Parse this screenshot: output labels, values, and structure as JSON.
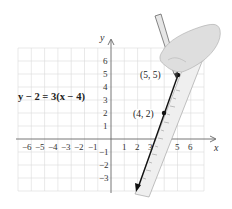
{
  "figure": {
    "equation": "y − 2 = 3(x − 4)",
    "axes": {
      "x_label": "x",
      "y_label": "y",
      "x_ticks": [
        "−6",
        "−5",
        "−4",
        "−3",
        "−2",
        "−1",
        "1",
        "2",
        "3",
        "4",
        "5",
        "6"
      ],
      "y_ticks": [
        "6",
        "5",
        "4",
        "3",
        "2",
        "1",
        "−1",
        "−2",
        "−3"
      ],
      "x_range": [
        -7,
        7
      ],
      "y_range": [
        -4,
        7
      ],
      "grid": true
    },
    "points": [
      {
        "label": "(5, 5)",
        "x": 5,
        "y": 5
      },
      {
        "label": "(4, 2)",
        "x": 4,
        "y": 2
      }
    ],
    "line": {
      "slope": 3,
      "through": [
        4,
        2
      ],
      "direction": "arrow pointing down-left",
      "color": "#111111"
    },
    "illustration": "hand holding pencil drawing the line along a ruler",
    "colors": {
      "grid": "#d9d9d9",
      "axis": "#666666",
      "ruler": "#eeeeee",
      "hand": "#dcdcdc"
    }
  }
}
